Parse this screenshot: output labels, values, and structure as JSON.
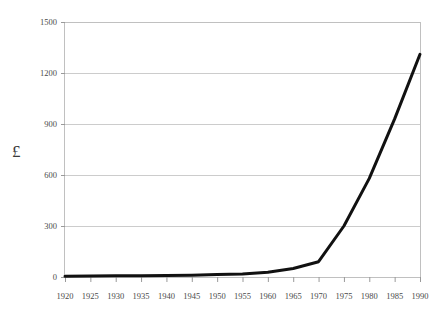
{
  "chart_data": {
    "type": "line",
    "title": "",
    "xlabel": "",
    "ylabel": "£",
    "x": [
      1920,
      1925,
      1930,
      1935,
      1940,
      1945,
      1950,
      1955,
      1960,
      1965,
      1970,
      1975,
      1980,
      1985,
      1990
    ],
    "values": [
      5,
      6,
      7,
      8,
      9,
      11,
      14,
      18,
      28,
      50,
      90,
      300,
      580,
      930,
      1310
    ],
    "series": [
      {
        "name": "£",
        "values": [
          5,
          6,
          7,
          8,
          9,
          11,
          14,
          18,
          28,
          50,
          90,
          300,
          580,
          930,
          1310
        ]
      }
    ],
    "xlim": [
      1920,
      1990
    ],
    "ylim": [
      0,
      1500
    ],
    "ytick_labels": [
      "0",
      "300",
      "600",
      "900",
      "1200",
      "1500"
    ],
    "yticks": [
      0,
      300,
      600,
      900,
      1200,
      1500
    ],
    "xtick_labels": [
      "1920",
      "1925",
      "1930",
      "1935",
      "1940",
      "1945",
      "1950",
      "1955",
      "1960",
      "1965",
      "1970",
      "1975",
      "1980",
      "1985",
      "1990"
    ],
    "grid": "horizontal",
    "legend": "none",
    "line_color": "#111111",
    "grid_color": "#cccccc",
    "axis_color": "#bbbbbb"
  },
  "figure": {
    "title_faded": "",
    "y_axis_symbol": "£"
  }
}
